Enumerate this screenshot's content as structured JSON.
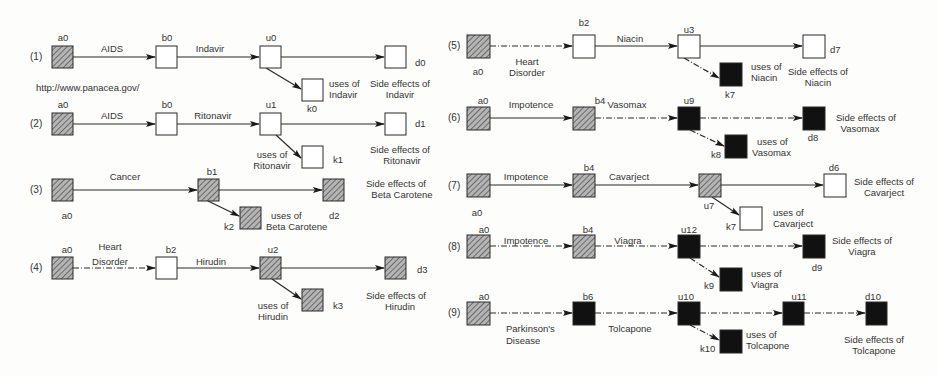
{
  "source_url": "http://www.panacea.gov/",
  "legend_colors": {
    "hatched": "#8a8a8a",
    "empty": "#ffffff",
    "filled": "#111111",
    "line": "#2a2a2a"
  },
  "rows": [
    {
      "no": "(1)",
      "a": "a0",
      "b": "b0",
      "u": "u0",
      "d": "d0",
      "k": "k0",
      "edge_ab": "AIDS",
      "edge_bu": "Indavir",
      "uses": "uses of Indavir",
      "side": "Side effects of Indavir",
      "uses_l1": "uses of",
      "uses_l2": "Indavir",
      "side_l1": "Side effects of",
      "side_l2": "Indavir"
    },
    {
      "no": "(2)",
      "a": "a0",
      "b": "b0",
      "u": "u1",
      "d": "d1",
      "k": "k1",
      "edge_ab": "AIDS",
      "edge_bu": "Ritonavir",
      "uses_l1": "uses of",
      "uses_l2": "Ritonavir",
      "side_l1": "Side effects of",
      "side_l2": "Ritonavir"
    },
    {
      "no": "(3)",
      "a": "a0",
      "b": "b1",
      "d": "d2",
      "k": "k2",
      "edge_ab": "Cancer",
      "uses_l1": "uses of",
      "uses_l2": "Beta Carotene",
      "side_l1": "Side effects of",
      "side_l2": "Beta Carotene"
    },
    {
      "no": "(4)",
      "a": "a0",
      "b": "b2",
      "u": "u2",
      "d": "d3",
      "k": "k3",
      "edge_ab_l1": "Heart",
      "edge_ab_l2": "Disorder",
      "edge_bu": "Hirudin",
      "uses_l1": "uses of",
      "uses_l2": "Hirudin",
      "side_l1": "Side effects of",
      "side_l2": "Hirudin"
    },
    {
      "no": "(5)",
      "a": "a0",
      "b": "b2",
      "u": "u3",
      "d": "d7",
      "k": "k7",
      "edge_ab_l1": "Heart",
      "edge_ab_l2": "Disorder",
      "edge_bu": "Niacin",
      "uses_l1": "uses of",
      "uses_l2": "Niacin",
      "side_l1": "Side effects of",
      "side_l2": "Niacin"
    },
    {
      "no": "(6)",
      "a": "a0",
      "b": "b4",
      "u": "u9",
      "d": "d8",
      "k": "k8",
      "edge_ab": "Impotence",
      "edge_bu": "Vasomax",
      "uses_l1": "uses of",
      "uses_l2": "Vasomax",
      "side_l1": "Side effects of",
      "side_l2": "Vasomax"
    },
    {
      "no": "(7)",
      "a": "a0",
      "b": "b4",
      "u": "u7",
      "d": "d6",
      "k": "k7",
      "edge_ab": "Impotence",
      "edge_bu": "Cavarject",
      "uses_l1": "uses of",
      "uses_l2": "Cavarject",
      "side_l1": "Side effects of",
      "side_l2": "Cavarject"
    },
    {
      "no": "(8)",
      "a": "a0",
      "b": "b4",
      "u": "u12",
      "d": "d9",
      "k": "k9",
      "edge_ab": "Impotence",
      "edge_bu": "Viagra",
      "uses_l1": "uses of",
      "uses_l2": "Viagra",
      "side_l1": "Side effects of",
      "side_l2": "Viagra"
    },
    {
      "no": "(9)",
      "a": "a0",
      "b": "b6",
      "u": "u10",
      "u2": "u11",
      "d": "d10",
      "k": "k10",
      "edge_ab_l1": "Parkinson's",
      "edge_ab_l2": "Disease",
      "edge_bu": "Tolcapone",
      "uses_l1": "uses of",
      "uses_l2": "Tolcapone",
      "side_l1": "Side effects of",
      "side_l2": "Tolcapone"
    }
  ]
}
